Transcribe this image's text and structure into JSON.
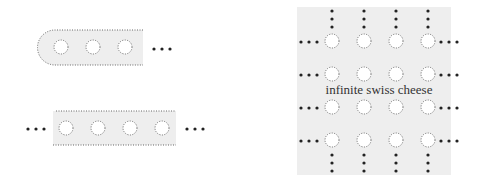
{
  "colors": {
    "fill": "#eeeeee",
    "stroke": "#666666",
    "dot": "#222222",
    "hole": "#ffffff"
  },
  "figures": [
    {
      "name": "half-infinite-strip",
      "description": "strip with rounded left end and holes, continuing right",
      "hole_count": 3,
      "ellipsis": "right"
    },
    {
      "name": "infinite-strip",
      "description": "strip with holes, continuing both directions",
      "hole_count": 4,
      "ellipsis": "both"
    },
    {
      "name": "infinite-swiss-cheese",
      "description": "plane with grid of holes, continuing in all directions",
      "grid": [
        4,
        4
      ],
      "label": "infinite swiss cheese"
    }
  ]
}
